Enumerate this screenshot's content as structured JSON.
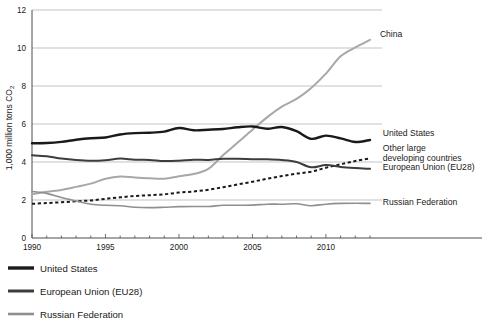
{
  "chart_data": {
    "type": "line",
    "title": "",
    "xlabel": "",
    "ylabel": "1,000 million tons CO₂",
    "xlim": [
      1990,
      2013
    ],
    "ylim": [
      0,
      12
    ],
    "grid": true,
    "legend_position": "bottom-left",
    "y_ticks": [
      "0",
      "2",
      "4",
      "6",
      "8",
      "10",
      "12"
    ],
    "y_tick_values": [
      0,
      2,
      4,
      6,
      8,
      10,
      12
    ],
    "x_ticks": [
      "1990",
      "1995",
      "2000",
      "2005",
      "2010"
    ],
    "x_tick_values": [
      1990,
      1995,
      2000,
      2005,
      2010
    ],
    "x_minor_step": 1,
    "x": [
      1990,
      1991,
      1992,
      1993,
      1994,
      1995,
      1996,
      1997,
      1998,
      1999,
      2000,
      2001,
      2002,
      2003,
      2004,
      2005,
      2006,
      2007,
      2008,
      2009,
      2010,
      2011,
      2012,
      2013
    ],
    "series": [
      {
        "name": "China",
        "label": "China",
        "color": "#a8a8a8",
        "style": "solid",
        "width": 2.0,
        "label_x": 2013.4,
        "label_y": 10.75,
        "values": [
          2.3,
          2.43,
          2.53,
          2.69,
          2.86,
          3.12,
          3.24,
          3.18,
          3.14,
          3.12,
          3.25,
          3.37,
          3.64,
          4.35,
          5.02,
          5.7,
          6.35,
          6.91,
          7.32,
          7.9,
          8.65,
          9.56,
          10.03,
          10.43
        ]
      },
      {
        "name": "United States",
        "label": "United States",
        "color": "#1a1a1a",
        "style": "solid",
        "width": 2.4,
        "label_x": 2013.6,
        "label_y": 5.55,
        "values": [
          4.99,
          5.0,
          5.06,
          5.17,
          5.25,
          5.29,
          5.45,
          5.52,
          5.54,
          5.6,
          5.79,
          5.67,
          5.7,
          5.74,
          5.83,
          5.87,
          5.75,
          5.84,
          5.62,
          5.22,
          5.39,
          5.24,
          5.05,
          5.16
        ]
      },
      {
        "name": "Other large developing countries",
        "label": "Other large\ndeveloping countries",
        "color": "#1a1a1a",
        "style": "dashed",
        "width": 2.0,
        "label_x": 2013.6,
        "label_y": 4.45,
        "values": [
          1.8,
          1.84,
          1.88,
          1.93,
          1.98,
          2.06,
          2.14,
          2.21,
          2.25,
          2.3,
          2.39,
          2.45,
          2.54,
          2.67,
          2.82,
          2.96,
          3.12,
          3.26,
          3.39,
          3.49,
          3.7,
          3.88,
          4.05,
          4.19
        ]
      },
      {
        "name": "European Union (EU28)",
        "label": "European Union (EU28)",
        "color": "#3d3d3d",
        "style": "solid",
        "width": 2.0,
        "label_x": 2013.6,
        "label_y": 3.72,
        "values": [
          4.35,
          4.3,
          4.18,
          4.1,
          4.06,
          4.09,
          4.18,
          4.12,
          4.11,
          4.05,
          4.07,
          4.12,
          4.11,
          4.17,
          4.17,
          4.15,
          4.14,
          4.1,
          4.0,
          3.72,
          3.84,
          3.74,
          3.68,
          3.64
        ]
      },
      {
        "name": "Russian Federation",
        "label": "Russian Federation",
        "color": "#8f8f8f",
        "style": "solid",
        "width": 1.6,
        "label_x": 2013.6,
        "label_y": 1.9,
        "values": [
          2.45,
          2.35,
          2.13,
          1.95,
          1.78,
          1.72,
          1.7,
          1.62,
          1.6,
          1.62,
          1.65,
          1.66,
          1.66,
          1.72,
          1.72,
          1.73,
          1.78,
          1.78,
          1.8,
          1.7,
          1.78,
          1.82,
          1.83,
          1.82
        ]
      }
    ]
  },
  "legend": {
    "items": [
      {
        "label": "United States",
        "color": "#1a1a1a",
        "width": 3.4
      },
      {
        "label": "European Union (EU28)",
        "color": "#3d3d3d",
        "width": 3.0
      },
      {
        "label": "Russian Federation",
        "color": "#8f8f8f",
        "width": 2.6
      }
    ]
  }
}
